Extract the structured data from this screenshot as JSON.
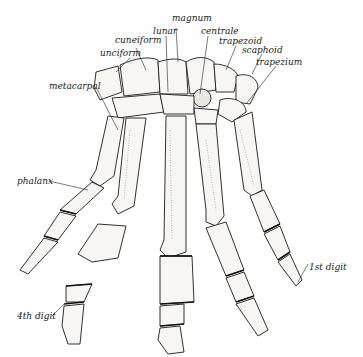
{
  "figure": {
    "labels": {
      "magnum": "magnum",
      "lunar": "lunar",
      "centrale": "centrale",
      "cuneiform": "cuneiform",
      "trapezoid": "trapezoid",
      "unciform": "unciform",
      "scaphoid": "scaphoid",
      "trapezium": "trapezium",
      "metacarpal": "metacarpal",
      "phalanx": "phalanx",
      "digit1": "1st digit",
      "digit4": "4th digit"
    },
    "colors": {
      "ink": "#1a1a1a",
      "bone_fill": "#f7f6f2",
      "background": "#ffffff"
    }
  }
}
